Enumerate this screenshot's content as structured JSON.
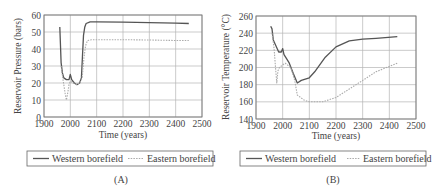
{
  "chart_data": [
    {
      "type": "line",
      "panel_label": "(A)",
      "title": "",
      "xlabel": "Time (years)",
      "ylabel": "Reservoir Pressure (bars)",
      "xlim": [
        1900,
        2500
      ],
      "ylim": [
        0,
        60
      ],
      "xticks": [
        1900,
        2000,
        2100,
        2200,
        2300,
        2400,
        2500
      ],
      "yticks": [
        0,
        10,
        20,
        30,
        40,
        50,
        60
      ],
      "grid": true,
      "legend_position": "bottom",
      "series": [
        {
          "name": "Western borefield",
          "style": "solid",
          "color": "#555555",
          "x": [
            1960,
            1962,
            1965,
            1970,
            1975,
            1985,
            1995,
            2000,
            2005,
            2015,
            2025,
            2035,
            2042,
            2046,
            2050,
            2055,
            2060,
            2075,
            2100,
            2200,
            2300,
            2400,
            2450
          ],
          "y": [
            53,
            45,
            32,
            26,
            23,
            22,
            22,
            25,
            22,
            20,
            19,
            20,
            23,
            35,
            48,
            53,
            55,
            56,
            56,
            55.8,
            55.5,
            55.2,
            55
          ]
        },
        {
          "name": "Eastern borefield",
          "style": "dotted",
          "color": "#aaaaaa",
          "x": [
            1965,
            1972,
            1980,
            1985,
            1990,
            1995,
            2000,
            2010,
            2025,
            2035,
            2045,
            2052,
            2058,
            2065,
            2080,
            2100,
            2200,
            2300,
            2400,
            2450
          ],
          "y": [
            30,
            22,
            14,
            10,
            14,
            19,
            21,
            20,
            19,
            20,
            23,
            35,
            42,
            45,
            45.5,
            45.5,
            45.5,
            45.3,
            45,
            45
          ]
        }
      ]
    },
    {
      "type": "line",
      "panel_label": "(B)",
      "title": "",
      "xlabel": "Time (years)",
      "ylabel": "Reservoir Temperature (°C)",
      "xlim": [
        1900,
        2500
      ],
      "ylim": [
        140,
        260
      ],
      "xticks": [
        1900,
        2000,
        2100,
        2200,
        2300,
        2400,
        2500
      ],
      "yticks": [
        140,
        160,
        180,
        200,
        220,
        240,
        260
      ],
      "grid": true,
      "legend_position": "bottom",
      "series": [
        {
          "name": "Western borefield",
          "style": "solid",
          "color": "#555555",
          "x": [
            1955,
            1960,
            1965,
            1975,
            1985,
            1995,
            2000,
            2005,
            2015,
            2025,
            2040,
            2055,
            2070,
            2100,
            2120,
            2160,
            2200,
            2250,
            2300,
            2350,
            2430
          ],
          "y": [
            248,
            245,
            232,
            225,
            218,
            218,
            222,
            215,
            210,
            205,
            193,
            182,
            185,
            188,
            195,
            212,
            224,
            231,
            233,
            234,
            236
          ]
        },
        {
          "name": "Eastern borefield",
          "style": "dotted",
          "color": "#aaaaaa",
          "x": [
            1960,
            1968,
            1973,
            1978,
            1982,
            1988,
            2000,
            2010,
            2030,
            2045,
            2055,
            2080,
            2100,
            2150,
            2200,
            2250,
            2300,
            2350,
            2430
          ],
          "y": [
            240,
            222,
            200,
            182,
            196,
            200,
            203,
            205,
            200,
            185,
            168,
            162,
            160,
            160,
            165,
            175,
            185,
            195,
            205
          ]
        }
      ]
    }
  ],
  "panels": [
    {
      "label": "(A)",
      "xlabel": "Time (years)",
      "ylabel": "Reservoir Pressure (bars)",
      "xticks": [
        "1900",
        "2000",
        "2100",
        "2200",
        "2300",
        "2400",
        "2500"
      ],
      "yticks": [
        "0",
        "10",
        "20",
        "30",
        "40",
        "50",
        "60"
      ],
      "legend": [
        "Western borefield",
        "Eastern borefield"
      ]
    },
    {
      "label": "(B)",
      "xlabel": "Time (years)",
      "ylabel": "Reservoir Temperature (°C)",
      "xticks": [
        "1900",
        "2000",
        "2100",
        "2200",
        "2300",
        "2400",
        "2500"
      ],
      "yticks": [
        "140",
        "160",
        "180",
        "200",
        "220",
        "240",
        "260"
      ],
      "legend": [
        "Western borefield",
        "Eastern borefield"
      ]
    }
  ],
  "colors": {
    "western": "#555555",
    "eastern": "#aaaaaa",
    "grid": "#999999",
    "frame": "#777777"
  }
}
